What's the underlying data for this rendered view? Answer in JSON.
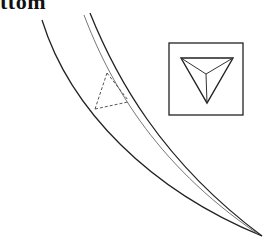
{
  "figure": {
    "title_fragment": "ttom",
    "colors": {
      "line": "#222222",
      "secondary_line": "#555555",
      "background": "#ffffff"
    }
  },
  "elements": {
    "outer_curve": "outer edge curve",
    "inner_curve_a": "inner edge curve",
    "inner_curve_b": "inner edge curve (thin)",
    "dashed_section": "dashed cross-section lines",
    "inset": {
      "label": "inset view",
      "shape": "inverted triangle with pyramid facets"
    }
  }
}
